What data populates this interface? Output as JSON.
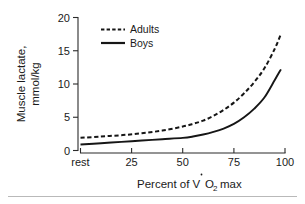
{
  "chart_data": {
    "type": "line",
    "title": "",
    "xlabel": "Percent of VO 2 max",
    "xlabel_parts": {
      "pre": "Percent of V",
      "o": "O",
      "sub": "2",
      "post": " max"
    },
    "ylabel_line1": "Muscle lactate,",
    "ylabel_line2": "mmol/kg",
    "xlim": [
      0,
      100
    ],
    "ylim": [
      0,
      20
    ],
    "grid": false,
    "legend_position": "top-left-inside",
    "x_tick_labels": [
      "rest",
      "25",
      "50",
      "75",
      "100"
    ],
    "x_tick_values": [
      0,
      25,
      50,
      75,
      100
    ],
    "y_tick_labels": [
      "0",
      "5",
      "10",
      "15",
      "20"
    ],
    "y_tick_values": [
      0,
      5,
      10,
      15,
      20
    ],
    "x": [
      0,
      10,
      20,
      30,
      40,
      50,
      55,
      60,
      65,
      70,
      75,
      80,
      85,
      90,
      95,
      98
    ],
    "series": [
      {
        "name": "Adults",
        "style": "dashed",
        "color": "#161616",
        "values": [
          1.9,
          2.1,
          2.3,
          2.6,
          3.0,
          3.6,
          4.0,
          4.5,
          5.2,
          6.1,
          7.2,
          8.6,
          10.3,
          12.4,
          15.3,
          17.5
        ]
      },
      {
        "name": "Boys",
        "style": "solid",
        "color": "#161616",
        "values": [
          0.9,
          1.1,
          1.3,
          1.5,
          1.7,
          1.9,
          2.1,
          2.4,
          2.8,
          3.3,
          4.0,
          5.0,
          6.3,
          8.0,
          10.6,
          12.2
        ]
      }
    ],
    "annotations": []
  },
  "legend": {
    "entries": [
      {
        "label": "Adults",
        "style": "dashed"
      },
      {
        "label": "Boys",
        "style": "solid"
      }
    ]
  },
  "axis": {
    "y_title_line1": "Muscle lactate,",
    "y_title_line2": "mmol/kg",
    "x_title_pre": "Percent of V",
    "x_title_o": "O",
    "x_title_sub": "2",
    "x_title_post": "max",
    "y_ticks": [
      "20",
      "15",
      "10",
      "5",
      "0"
    ],
    "x_ticks": [
      "rest",
      "25",
      "50",
      "75",
      "100"
    ]
  },
  "colors": {
    "line": "#161616",
    "axis": "#2b2b2b",
    "text": "#1a1a1a",
    "background": "#ffffff",
    "footer_rule": "#b9b9b9"
  }
}
